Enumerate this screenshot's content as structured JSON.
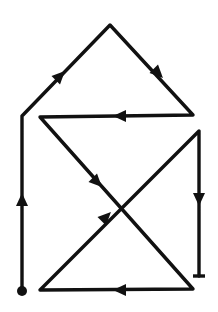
{
  "diagram": {
    "type": "single-stroke path with direction arrows",
    "stroke_color": "#111111",
    "background": "#ffffff",
    "start_marker": "filled-dot",
    "end_marker": "t-bar",
    "path_points": [
      [
        22,
        291
      ],
      [
        22,
        116
      ],
      [
        110,
        25
      ],
      [
        193,
        115
      ],
      [
        40,
        117
      ],
      [
        193,
        289
      ],
      [
        40,
        290
      ],
      [
        199,
        131
      ],
      [
        199,
        276
      ]
    ],
    "arrows": [
      {
        "x": 22,
        "y": 200,
        "dir": "up"
      },
      {
        "x": 60,
        "y": 76,
        "dir": "up-right"
      },
      {
        "x": 158,
        "y": 73,
        "dir": "down-right"
      },
      {
        "x": 120,
        "y": 116,
        "dir": "left"
      },
      {
        "x": 97,
        "y": 182,
        "dir": "down-right"
      },
      {
        "x": 106,
        "y": 217,
        "dir": "up-right"
      },
      {
        "x": 120,
        "y": 290,
        "dir": "left"
      },
      {
        "x": 199,
        "y": 199,
        "dir": "down"
      }
    ]
  }
}
